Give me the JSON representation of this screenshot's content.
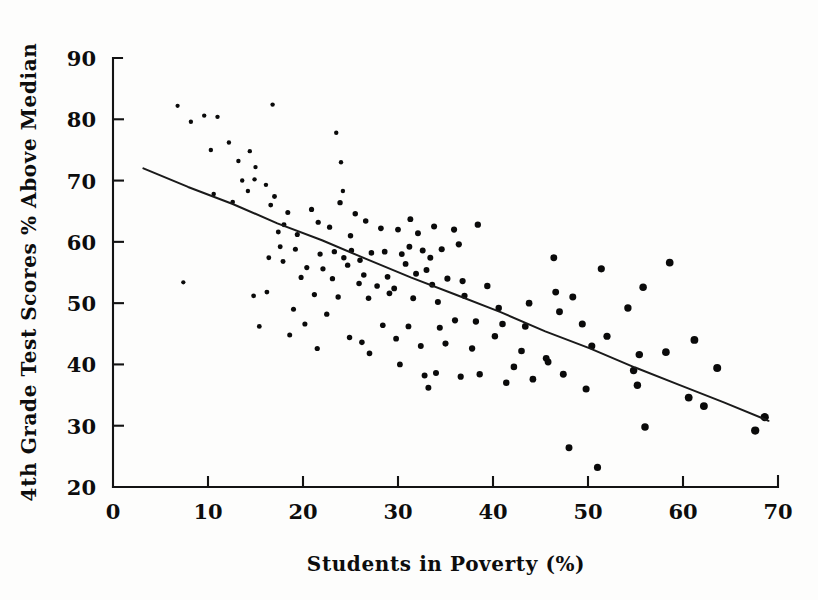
{
  "figure": {
    "background_color": "#fdfdfc",
    "ink_color": "#0d0d0d"
  },
  "chart_data": {
    "type": "scatter",
    "title": "",
    "xlabel": "Students in Poverty (%)",
    "ylabel": "4th Grade Test Scores % Above Median",
    "xlim": [
      0,
      70
    ],
    "ylim": [
      20,
      90
    ],
    "xticks": [
      0,
      10,
      20,
      30,
      40,
      50,
      60,
      70
    ],
    "yticks": [
      20,
      30,
      40,
      50,
      60,
      70,
      80,
      90
    ],
    "xtick_labels": [
      "0",
      "10",
      "20",
      "30",
      "40",
      "50",
      "60",
      "70"
    ],
    "ytick_labels": [
      "20",
      "30",
      "40",
      "50",
      "60",
      "70",
      "80",
      "90"
    ],
    "grid": false,
    "legend": null,
    "annotations": [],
    "trendline": {
      "type": "linear-fit",
      "x_start": 3.2,
      "y_start": 72.0,
      "x_end": 69.0,
      "y_end": 30.8,
      "slope": -0.626,
      "intercept": 74.0
    },
    "points": [
      [
        6.8,
        82.2
      ],
      [
        9.6,
        80.6
      ],
      [
        11.0,
        80.4
      ],
      [
        8.2,
        79.6
      ],
      [
        16.8,
        82.4
      ],
      [
        12.2,
        76.2
      ],
      [
        14.4,
        74.8
      ],
      [
        10.3,
        75.0
      ],
      [
        13.2,
        73.2
      ],
      [
        15.0,
        72.2
      ],
      [
        14.9,
        70.2
      ],
      [
        23.5,
        77.8
      ],
      [
        24.0,
        73.0
      ],
      [
        13.6,
        70.0
      ],
      [
        14.2,
        68.3
      ],
      [
        16.1,
        69.3
      ],
      [
        17.0,
        67.4
      ],
      [
        16.6,
        66.0
      ],
      [
        12.6,
        66.5
      ],
      [
        10.6,
        67.8
      ],
      [
        24.2,
        68.3
      ],
      [
        23.9,
        66.4
      ],
      [
        18.4,
        64.8
      ],
      [
        20.9,
        65.3
      ],
      [
        25.5,
        64.6
      ],
      [
        21.6,
        63.2
      ],
      [
        18.0,
        62.8
      ],
      [
        26.6,
        63.4
      ],
      [
        7.4,
        53.4
      ],
      [
        17.4,
        61.6
      ],
      [
        19.4,
        61.2
      ],
      [
        22.8,
        62.4
      ],
      [
        25.0,
        61.0
      ],
      [
        28.2,
        62.2
      ],
      [
        33.8,
        62.5
      ],
      [
        31.3,
        63.7
      ],
      [
        30.0,
        62.0
      ],
      [
        32.1,
        61.4
      ],
      [
        35.9,
        62.0
      ],
      [
        36.4,
        59.6
      ],
      [
        38.4,
        62.8
      ],
      [
        17.6,
        59.2
      ],
      [
        19.2,
        58.8
      ],
      [
        21.8,
        58.0
      ],
      [
        23.3,
        58.4
      ],
      [
        24.3,
        57.4
      ],
      [
        25.1,
        58.6
      ],
      [
        26.0,
        57.0
      ],
      [
        27.2,
        58.2
      ],
      [
        28.6,
        58.4
      ],
      [
        30.4,
        58.0
      ],
      [
        31.2,
        59.2
      ],
      [
        32.6,
        58.6
      ],
      [
        33.4,
        57.4
      ],
      [
        34.6,
        58.8
      ],
      [
        30.8,
        56.4
      ],
      [
        24.7,
        56.2
      ],
      [
        22.1,
        55.6
      ],
      [
        20.4,
        55.8
      ],
      [
        17.9,
        56.8
      ],
      [
        16.4,
        57.4
      ],
      [
        19.8,
        54.2
      ],
      [
        23.1,
        54.0
      ],
      [
        26.4,
        54.6
      ],
      [
        28.9,
        54.3
      ],
      [
        31.9,
        54.8
      ],
      [
        33.0,
        55.4
      ],
      [
        35.2,
        54.0
      ],
      [
        36.8,
        53.6
      ],
      [
        39.4,
        52.8
      ],
      [
        33.6,
        53.0
      ],
      [
        29.6,
        52.4
      ],
      [
        27.8,
        52.8
      ],
      [
        25.9,
        53.2
      ],
      [
        21.2,
        51.4
      ],
      [
        23.7,
        51.0
      ],
      [
        26.9,
        50.8
      ],
      [
        29.1,
        51.6
      ],
      [
        31.6,
        50.8
      ],
      [
        34.2,
        50.2
      ],
      [
        37.0,
        51.2
      ],
      [
        40.6,
        49.2
      ],
      [
        43.8,
        50.0
      ],
      [
        46.4,
        57.4
      ],
      [
        51.4,
        55.6
      ],
      [
        55.8,
        52.6
      ],
      [
        58.6,
        56.6
      ],
      [
        46.6,
        51.8
      ],
      [
        47.0,
        48.6
      ],
      [
        48.4,
        51.0
      ],
      [
        54.2,
        49.2
      ],
      [
        49.4,
        46.6
      ],
      [
        43.4,
        46.2
      ],
      [
        41.0,
        46.6
      ],
      [
        38.2,
        47.0
      ],
      [
        36.0,
        47.2
      ],
      [
        34.4,
        46.0
      ],
      [
        31.1,
        46.2
      ],
      [
        28.4,
        46.4
      ],
      [
        22.5,
        48.2
      ],
      [
        19.0,
        49.0
      ],
      [
        16.2,
        51.8
      ],
      [
        20.2,
        46.6
      ],
      [
        24.9,
        44.4
      ],
      [
        26.2,
        43.6
      ],
      [
        29.8,
        44.2
      ],
      [
        32.4,
        43.0
      ],
      [
        35.0,
        43.4
      ],
      [
        37.8,
        42.6
      ],
      [
        40.2,
        44.6
      ],
      [
        43.0,
        42.2
      ],
      [
        45.6,
        41.0
      ],
      [
        50.4,
        43.0
      ],
      [
        52.0,
        44.6
      ],
      [
        55.4,
        41.6
      ],
      [
        58.2,
        42.0
      ],
      [
        61.2,
        44.0
      ],
      [
        63.6,
        39.4
      ],
      [
        60.6,
        34.6
      ],
      [
        55.2,
        36.6
      ],
      [
        54.8,
        39.0
      ],
      [
        47.4,
        38.4
      ],
      [
        45.8,
        40.4
      ],
      [
        44.2,
        37.6
      ],
      [
        41.4,
        37.0
      ],
      [
        38.6,
        38.4
      ],
      [
        36.6,
        38.0
      ],
      [
        34.0,
        38.6
      ],
      [
        32.8,
        38.2
      ],
      [
        33.2,
        36.2
      ],
      [
        56.0,
        29.8
      ],
      [
        62.2,
        33.2
      ],
      [
        67.6,
        29.2
      ],
      [
        68.6,
        31.4
      ],
      [
        48.0,
        26.4
      ],
      [
        51.0,
        23.2
      ],
      [
        21.5,
        42.6
      ],
      [
        18.6,
        44.8
      ],
      [
        15.4,
        46.2
      ],
      [
        14.8,
        51.2
      ],
      [
        27.0,
        41.8
      ],
      [
        30.2,
        40.0
      ],
      [
        42.2,
        39.6
      ],
      [
        49.8,
        36.0
      ]
    ]
  },
  "axis": {
    "x_axis_name": "x-axis",
    "y_axis_name": "y-axis",
    "tick_direction": "inward"
  }
}
